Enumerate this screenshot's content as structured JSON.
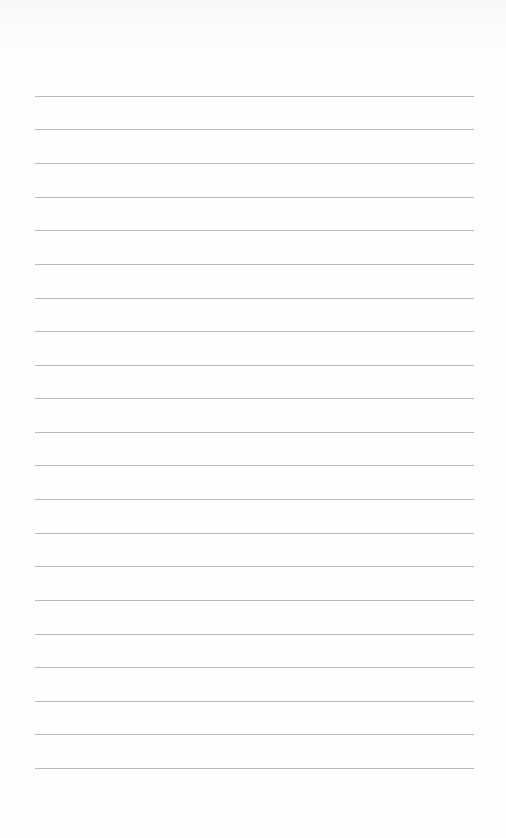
{
  "page": {
    "type": "lined-paper",
    "background": "#fefefe",
    "line_color": "#b8b8b8",
    "line_count": 21,
    "lines": [
      {
        "top": 96
      },
      {
        "top": 129
      },
      {
        "top": 163
      },
      {
        "top": 197
      },
      {
        "top": 230
      },
      {
        "top": 264
      },
      {
        "top": 298
      },
      {
        "top": 331
      },
      {
        "top": 365
      },
      {
        "top": 398
      },
      {
        "top": 432
      },
      {
        "top": 465
      },
      {
        "top": 499
      },
      {
        "top": 533
      },
      {
        "top": 566
      },
      {
        "top": 600
      },
      {
        "top": 634
      },
      {
        "top": 667
      },
      {
        "top": 701
      },
      {
        "top": 734
      },
      {
        "top": 768
      }
    ]
  }
}
